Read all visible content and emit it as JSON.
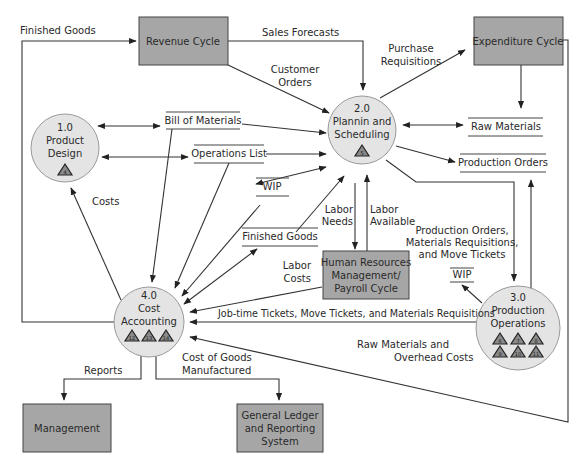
{
  "diagram": {
    "type": "data-flow-diagram",
    "external_entities": {
      "revenue_cycle": "Revenue Cycle",
      "expenditure_cycle": "Expenditure Cycle",
      "hr_payroll": [
        "Human Resources",
        "Management/",
        "Payroll Cycle"
      ],
      "management": "Management",
      "general_ledger": [
        "General Ledger",
        "and Reporting",
        "System"
      ]
    },
    "processes": {
      "p1": {
        "number": "1.0",
        "lines": [
          "Product",
          "Design"
        ],
        "triangles": [
          "4"
        ]
      },
      "p2": {
        "number": "2.0",
        "lines": [
          "Plannin and",
          "Scheduling"
        ],
        "triangles": [
          "5"
        ]
      },
      "p3": {
        "number": "3.0",
        "lines": [
          "Production",
          "Operations"
        ],
        "triangles": [
          "6",
          "7",
          "8",
          "9",
          "10",
          "11"
        ]
      },
      "p4": {
        "number": "4.0",
        "lines": [
          "Cost",
          "Accounting"
        ],
        "triangles": [
          "12",
          "13",
          "14"
        ]
      }
    },
    "data_stores": {
      "bill_of_materials": "Bill of Materials",
      "operations_list": "Operations List",
      "wip_left": "WIP",
      "finished_goods": "Finished Goods",
      "raw_materials": "Raw Materials",
      "production_orders": "Production Orders",
      "wip_right": "WIP"
    },
    "flows": {
      "finished_goods": "Finished Goods",
      "sales_forecasts": "Sales Forecasts",
      "customer_orders": [
        "Customer",
        "Orders"
      ],
      "purchase_requisitions": [
        "Purchase",
        "Requisitions"
      ],
      "costs": "Costs",
      "labor_needs": [
        "Labor",
        "Needs"
      ],
      "labor_available": [
        "Labor",
        "Available"
      ],
      "labor_costs": [
        "Labor",
        "Costs"
      ],
      "prod_orders_mat_req": [
        "Production Orders,",
        "Materials Requisitions,",
        "and Move Tickets"
      ],
      "job_time_tickets": "Job-time Tickets, Move Tickets, and Materials Requisitions",
      "raw_mat_overhead": [
        "Raw Materials and",
        "Overhead Costs"
      ],
      "reports": "Reports",
      "cogm": [
        "Cost of Goods",
        "Manufactured"
      ]
    },
    "colors": {
      "entity_fill": "#a6a6a6",
      "process_fill": "#e4e4e4",
      "line": "#333333",
      "background": "#ffffff"
    }
  }
}
